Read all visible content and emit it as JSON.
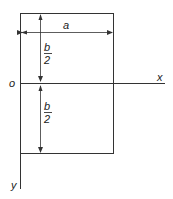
{
  "diagram": {
    "type": "rectangular-plate-coordinate-sketch",
    "labels": {
      "width": "a",
      "half_height_top_num": "b",
      "half_height_top_den": "2",
      "half_height_bottom_num": "b",
      "half_height_bottom_den": "2",
      "origin": "o",
      "x_axis": "x",
      "y_axis": "y"
    },
    "colors": {
      "line": "#333333",
      "text": "#222222",
      "background": "#ffffff"
    }
  }
}
